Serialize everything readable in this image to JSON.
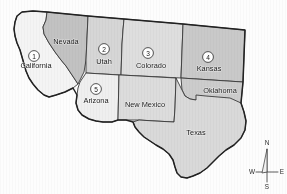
{
  "figure": {
    "name": "western-united-states-map",
    "background_color": "#fdfdfd"
  },
  "states": [
    {
      "id": "california",
      "label": "California",
      "marker": "1",
      "fill": "#f4f4f4",
      "label_x": 36,
      "label_y": 66,
      "marker_x": 34,
      "marker_y": 56
    },
    {
      "id": "nevada",
      "label": "Nevada",
      "marker": "",
      "fill": "#c2c2c2",
      "label_x": 66,
      "label_y": 42,
      "marker_x": 0,
      "marker_y": 0
    },
    {
      "id": "utah",
      "label": "Utah",
      "marker": "2",
      "fill": "#d6d6d6",
      "label_x": 104,
      "label_y": 62,
      "marker_x": 104,
      "marker_y": 49
    },
    {
      "id": "colorado",
      "label": "Colorado",
      "marker": "3",
      "fill": "#dedede",
      "label_x": 151,
      "label_y": 66,
      "marker_x": 148,
      "marker_y": 53
    },
    {
      "id": "kansas",
      "label": "Kansas",
      "marker": "4",
      "fill": "#c9c9c9",
      "label_x": 209,
      "label_y": 69,
      "marker_x": 208,
      "marker_y": 57
    },
    {
      "id": "arizona",
      "label": "Arizona",
      "marker": "5",
      "fill": "#efefef",
      "label_x": 96,
      "label_y": 101,
      "marker_x": 96,
      "marker_y": 89
    },
    {
      "id": "new-mexico",
      "label": "New Mexico",
      "marker": "",
      "fill": "#dcdcdc",
      "label_x": 145,
      "label_y": 105,
      "marker_x": 0,
      "marker_y": 0
    },
    {
      "id": "oklahoma",
      "label": "Oklahoma",
      "marker": "",
      "fill": "#cccccc",
      "label_x": 220,
      "label_y": 91,
      "marker_x": 0,
      "marker_y": 0
    },
    {
      "id": "texas",
      "label": "Texas",
      "marker": "",
      "fill": "#d9d9d9",
      "label_x": 196,
      "label_y": 133,
      "marker_x": 0,
      "marker_y": 0
    }
  ],
  "compass": {
    "north": "N",
    "south": "S",
    "east": "E",
    "west": "W"
  },
  "legend_numbers": [
    "1",
    "2",
    "3",
    "4",
    "5"
  ]
}
